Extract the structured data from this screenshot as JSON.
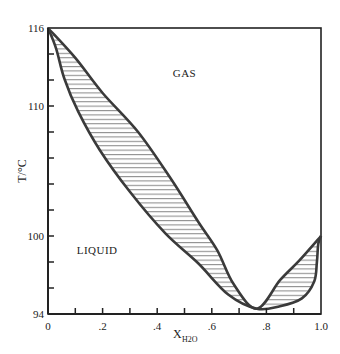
{
  "chart_data": {
    "type": "line",
    "title": "",
    "xlabel": "X",
    "xlabel_subscript": "H2O",
    "ylabel": "T/°C",
    "xlim": [
      0,
      1.0
    ],
    "ylim": [
      94,
      116
    ],
    "grid": false,
    "legend": null,
    "x_ticks": [
      0,
      0.1,
      0.2,
      0.3,
      0.4,
      0.5,
      0.6,
      0.7,
      0.8,
      0.9,
      1.0
    ],
    "x_tick_labels": [
      {
        "value": 0,
        "label": "0"
      },
      {
        "value": 0.2,
        "label": ".2"
      },
      {
        "value": 0.4,
        "label": ".4"
      },
      {
        "value": 0.6,
        "label": ".6"
      },
      {
        "value": 0.8,
        "label": ".8"
      },
      {
        "value": 1.0,
        "label": "1.0"
      }
    ],
    "y_ticks": [
      94,
      96,
      98,
      100,
      102,
      104,
      106,
      108,
      110,
      112,
      114,
      116
    ],
    "y_tick_labels": [
      {
        "value": 116,
        "label": "116"
      },
      {
        "value": 110,
        "label": "110"
      },
      {
        "value": 100,
        "label": "100"
      },
      {
        "value": 94,
        "label": "94"
      }
    ],
    "annotations": [
      {
        "text": "GAS",
        "x": 0.5,
        "y": 112.2
      },
      {
        "text": "LIQUID",
        "x": 0.18,
        "y": 98.6
      }
    ],
    "series": [
      {
        "name": "bubble curve (liquid)",
        "x": [
          0.0,
          0.03,
          0.06,
          0.11,
          0.19,
          0.3,
          0.43,
          0.55,
          0.66,
          0.765,
          0.85,
          0.93,
          0.975,
          0.985,
          0.99,
          1.0
        ],
        "y": [
          116,
          114.4,
          112.1,
          109.6,
          106.6,
          103.4,
          100.2,
          97.9,
          95.5,
          94.4,
          94.6,
          95.2,
          96.5,
          98.0,
          99.4,
          100.0
        ]
      },
      {
        "name": "dew curve (vapor)",
        "x": [
          0.0,
          0.1,
          0.2,
          0.33,
          0.45,
          0.55,
          0.62,
          0.68,
          0.765,
          0.85,
          0.92,
          1.0
        ],
        "y": [
          116,
          113.7,
          111.0,
          108.0,
          104.4,
          101.1,
          98.9,
          96.3,
          94.4,
          96.6,
          98.1,
          100.0
        ]
      }
    ],
    "azeotrope": {
      "x": 0.765,
      "y": 94.4
    },
    "hatch_between_curves": true
  },
  "colors": {
    "curve": "#3a3a3a",
    "axis": "#222222",
    "hatch": "#777777"
  }
}
